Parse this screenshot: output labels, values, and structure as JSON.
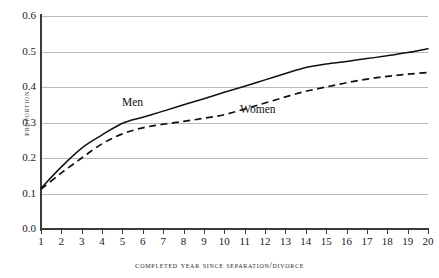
{
  "chart_data": {
    "type": "line",
    "title": "",
    "xlabel": "Completed Year Since Separation/Divorce",
    "ylabel": "Proportion",
    "xlim": [
      1,
      20
    ],
    "ylim": [
      0.0,
      0.6
    ],
    "grid": true,
    "legend_position": "inline-annotations",
    "x": [
      1,
      2,
      3,
      4,
      5,
      6,
      7,
      8,
      9,
      10,
      11,
      12,
      13,
      14,
      15,
      16,
      17,
      18,
      19,
      20
    ],
    "y_ticks": [
      "0.0",
      "0.1",
      "0.2",
      "0.3",
      "0.4",
      "0.5",
      "0.6"
    ],
    "y_tick_values": [
      0.0,
      0.1,
      0.2,
      0.3,
      0.4,
      0.5,
      0.6
    ],
    "x_ticks": [
      "1",
      "2",
      "3",
      "4",
      "5",
      "6",
      "7",
      "8",
      "9",
      "10",
      "11",
      "12",
      "13",
      "14",
      "15",
      "16",
      "17",
      "18",
      "19",
      "20"
    ],
    "series": [
      {
        "name": "Men",
        "style": "solid",
        "color": "#111111",
        "label_x": 8,
        "values": [
          0.115,
          0.175,
          0.228,
          0.265,
          0.298,
          0.315,
          0.332,
          0.35,
          0.367,
          0.385,
          0.402,
          0.42,
          0.438,
          0.455,
          0.465,
          0.472,
          0.48,
          0.488,
          0.497,
          0.508
        ]
      },
      {
        "name": "Women",
        "style": "dashed",
        "color": "#111111",
        "label_x": 12,
        "values": [
          0.112,
          0.158,
          0.2,
          0.24,
          0.268,
          0.285,
          0.295,
          0.303,
          0.312,
          0.322,
          0.338,
          0.355,
          0.372,
          0.388,
          0.4,
          0.412,
          0.422,
          0.43,
          0.436,
          0.441
        ]
      }
    ],
    "annotations": [
      {
        "text": "Men",
        "x_px": 122,
        "y_px": 103
      },
      {
        "text": "Women",
        "x_px": 240,
        "y_px": 110
      }
    ]
  }
}
